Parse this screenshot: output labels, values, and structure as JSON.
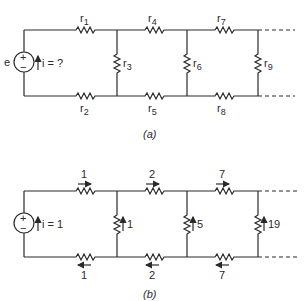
{
  "figure_a": {
    "caption": "(a)",
    "source": {
      "label": "e",
      "plus": "+",
      "minus": "−",
      "current_label": "i = ?"
    },
    "resistors": {
      "r1": "r",
      "r1_sub": "1",
      "r2": "r",
      "r2_sub": "2",
      "r3": "r",
      "r3_sub": "3",
      "r4": "r",
      "r4_sub": "4",
      "r5": "r",
      "r5_sub": "5",
      "r6": "r",
      "r6_sub": "6",
      "r7": "r",
      "r7_sub": "7",
      "r8": "r",
      "r8_sub": "8",
      "r9": "r",
      "r9_sub": "9"
    }
  },
  "figure_b": {
    "caption": "(b)",
    "source": {
      "plus": "+",
      "minus": "−",
      "current_label": "i = 1"
    },
    "currents": {
      "top_1": "1",
      "top_2": "2",
      "top_3": "7",
      "bottom_1": "1",
      "bottom_2": "2",
      "bottom_3": "7",
      "shunt_1": "1",
      "shunt_2": "5",
      "shunt_3": "19"
    }
  }
}
